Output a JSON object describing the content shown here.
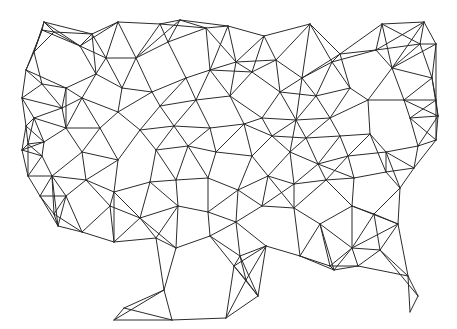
{
  "diagram": {
    "type": "triangulation-mesh",
    "background": "#ffffff",
    "line_color": "#2b2b2b",
    "nodes": [
      [
        54,
        32
      ],
      [
        42,
        30
      ],
      [
        34,
        52
      ],
      [
        26,
        70
      ],
      [
        22,
        98
      ],
      [
        26,
        126
      ],
      [
        22,
        150
      ],
      [
        28,
        176
      ],
      [
        40,
        196
      ],
      [
        54,
        214
      ],
      [
        44,
        22
      ],
      [
        92,
        34
      ],
      [
        118,
        22
      ],
      [
        160,
        24
      ],
      [
        180,
        20
      ],
      [
        228,
        26
      ],
      [
        264,
        36
      ],
      [
        310,
        24
      ],
      [
        340,
        54
      ],
      [
        382,
        24
      ],
      [
        424,
        22
      ],
      [
        436,
        44
      ],
      [
        80,
        46
      ],
      [
        106,
        58
      ],
      [
        136,
        58
      ],
      [
        168,
        42
      ],
      [
        206,
        28
      ],
      [
        236,
        62
      ],
      [
        276,
        60
      ],
      [
        302,
        78
      ],
      [
        332,
        62
      ],
      [
        376,
        50
      ],
      [
        420,
        44
      ],
      [
        42,
        84
      ],
      [
        66,
        88
      ],
      [
        96,
        74
      ],
      [
        122,
        88
      ],
      [
        152,
        92
      ],
      [
        186,
        78
      ],
      [
        210,
        70
      ],
      [
        252,
        72
      ],
      [
        280,
        92
      ],
      [
        316,
        96
      ],
      [
        350,
        88
      ],
      [
        392,
        68
      ],
      [
        432,
        78
      ],
      [
        34,
        118
      ],
      [
        62,
        108
      ],
      [
        82,
        98
      ],
      [
        118,
        112
      ],
      [
        160,
        106
      ],
      [
        196,
        100
      ],
      [
        230,
        96
      ],
      [
        262,
        118
      ],
      [
        296,
        120
      ],
      [
        330,
        118
      ],
      [
        368,
        100
      ],
      [
        404,
        100
      ],
      [
        436,
        100
      ],
      [
        28,
        144
      ],
      [
        44,
        142
      ],
      [
        66,
        128
      ],
      [
        100,
        128
      ],
      [
        140,
        130
      ],
      [
        174,
        126
      ],
      [
        210,
        128
      ],
      [
        244,
        124
      ],
      [
        272,
        136
      ],
      [
        306,
        138
      ],
      [
        340,
        136
      ],
      [
        370,
        134
      ],
      [
        410,
        118
      ],
      [
        438,
        116
      ],
      [
        42,
        156
      ],
      [
        82,
        152
      ],
      [
        118,
        160
      ],
      [
        156,
        150
      ],
      [
        188,
        146
      ],
      [
        216,
        152
      ],
      [
        252,
        156
      ],
      [
        290,
        152
      ],
      [
        318,
        164
      ],
      [
        348,
        156
      ],
      [
        386,
        152
      ],
      [
        418,
        146
      ],
      [
        436,
        140
      ],
      [
        52,
        176
      ],
      [
        86,
        180
      ],
      [
        114,
        192
      ],
      [
        150,
        182
      ],
      [
        176,
        180
      ],
      [
        208,
        178
      ],
      [
        238,
        190
      ],
      [
        268,
        176
      ],
      [
        294,
        184
      ],
      [
        326,
        180
      ],
      [
        354,
        178
      ],
      [
        386,
        172
      ],
      [
        414,
        168
      ],
      [
        66,
        196
      ],
      [
        110,
        206
      ],
      [
        140,
        218
      ],
      [
        178,
        206
      ],
      [
        208,
        212
      ],
      [
        236,
        222
      ],
      [
        262,
        206
      ],
      [
        294,
        208
      ],
      [
        320,
        224
      ],
      [
        352,
        206
      ],
      [
        374,
        214
      ],
      [
        400,
        188
      ],
      [
        58,
        226
      ],
      [
        82,
        232
      ],
      [
        114,
        242
      ],
      [
        156,
        238
      ],
      [
        176,
        248
      ],
      [
        210,
        236
      ],
      [
        240,
        256
      ],
      [
        266,
        246
      ],
      [
        300,
        256
      ],
      [
        330,
        266
      ],
      [
        352,
        248
      ],
      [
        380,
        250
      ],
      [
        398,
        224
      ],
      [
        114,
        320
      ],
      [
        124,
        308
      ],
      [
        172,
        320
      ],
      [
        164,
        290
      ],
      [
        226,
        318
      ],
      [
        234,
        266
      ],
      [
        246,
        280
      ],
      [
        258,
        296
      ],
      [
        334,
        270
      ],
      [
        358,
        266
      ],
      [
        408,
        276
      ],
      [
        418,
        296
      ],
      [
        410,
        312
      ]
    ],
    "edge_hint": "edges connect nearby nodes forming a Delaunay-like triangulation"
  }
}
